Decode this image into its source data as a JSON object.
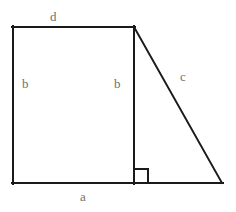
{
  "figure": {
    "background_color": "#ffffff",
    "stroke_color": "#1a1a1a",
    "label_color": "#6f6f6f",
    "stroke_width": 2,
    "labels": {
      "top": "d",
      "left_side": "b",
      "middle_altitude": "b",
      "hypotenuse": "c",
      "base": "a"
    },
    "right_angle_marker": {
      "name": "right-angle-square",
      "present": true
    },
    "geometry": {
      "top_left": [
        13,
        27
      ],
      "top_right": [
        134,
        27
      ],
      "bottom_left": [
        13,
        183
      ],
      "bottom_mid": [
        134,
        183
      ],
      "bottom_right": [
        222,
        183
      ]
    }
  }
}
